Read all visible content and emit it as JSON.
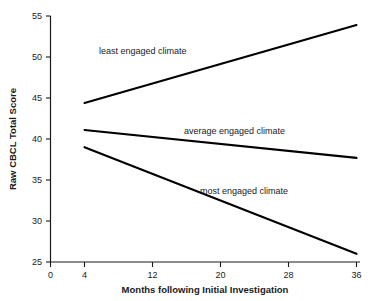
{
  "chart_data": {
    "type": "line",
    "title": "",
    "xlabel": "Months following Initial Investigation",
    "ylabel": "Raw CBCL Total Score",
    "xlim": [
      0,
      36
    ],
    "ylim": [
      25,
      55
    ],
    "xticks": [
      0,
      4,
      12,
      20,
      28,
      36
    ],
    "xtick_labels": [
      "0",
      "4",
      "12",
      "20",
      "28",
      "36"
    ],
    "yticks": [
      25,
      30,
      35,
      40,
      45,
      50,
      55
    ],
    "ytick_labels": [
      "25",
      "30",
      "35",
      "40",
      "45",
      "50",
      "55"
    ],
    "grid": false,
    "legend": "inline-annotations",
    "x": [
      4,
      36
    ],
    "series": [
      {
        "name": "least engaged climate",
        "label": "least engaged climate",
        "values": [
          44.4,
          53.9
        ],
        "color": "#000000",
        "label_x": 13,
        "label_y": 51.5
      },
      {
        "name": "average engaged climate",
        "label": "average engaged climate",
        "values": [
          41.1,
          37.7
        ],
        "color": "#000000",
        "label_x": 20.5,
        "label_y": 42.1
      },
      {
        "name": "most engaged climate",
        "label": "most engaged climate",
        "values": [
          39.0,
          26.0
        ],
        "color": "#000000",
        "label_x": 19.5,
        "label_y": 35.4
      }
    ]
  },
  "axis": {
    "y_title": "Raw CBCL Total Score",
    "x_title": "Months following Initial Investigation",
    "y_tick_0": "25",
    "y_tick_1": "30",
    "y_tick_2": "35",
    "y_tick_3": "40",
    "y_tick_4": "45",
    "y_tick_5": "50",
    "y_tick_6": "55",
    "x_tick_0": "0",
    "x_tick_1": "4",
    "x_tick_2": "12",
    "x_tick_3": "20",
    "x_tick_4": "28",
    "x_tick_5": "36"
  },
  "series_labels": {
    "least": "least engaged climate",
    "average": "average engaged climate",
    "most": "most engaged climate"
  }
}
